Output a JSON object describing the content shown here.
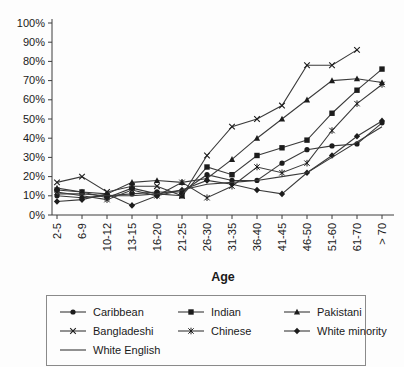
{
  "chart_data": {
    "type": "line",
    "title": "",
    "xlabel": "Age",
    "ylabel": "",
    "ylim": [
      0,
      100
    ],
    "y_tick_step": 10,
    "y_tick_labels": [
      "0%",
      "10%",
      "20%",
      "30%",
      "40%",
      "50%",
      "60%",
      "70%",
      "80%",
      "90%",
      "100%"
    ],
    "categories": [
      "2-5",
      "6-9",
      "10-12",
      "13-15",
      "16-20",
      "21-25",
      "26-30",
      "31-35",
      "36-40",
      "41-45",
      "46-50",
      "51-60",
      "61-70",
      "> 70"
    ],
    "series": [
      {
        "name": "Caribbean",
        "marker": "circle",
        "values": [
          10,
          9,
          10,
          11,
          12,
          12,
          21,
          18,
          18,
          27,
          34,
          36,
          37,
          48
        ]
      },
      {
        "name": "Indian",
        "marker": "square",
        "values": [
          13,
          12,
          9,
          14,
          11,
          10,
          25,
          21,
          31,
          35,
          39,
          53,
          65,
          76
        ]
      },
      {
        "name": "Pakistani",
        "marker": "triangle",
        "values": [
          14,
          12,
          11,
          17,
          18,
          17,
          19,
          29,
          40,
          50,
          60,
          70,
          71,
          69
        ]
      },
      {
        "name": "Bangladeshi",
        "marker": "x",
        "values": [
          17,
          20,
          12,
          15,
          15,
          10,
          31,
          46,
          50,
          57,
          78,
          78,
          86,
          null
        ]
      },
      {
        "name": "Chinese",
        "marker": "asterisk",
        "values": [
          12,
          10,
          8,
          13,
          10,
          17,
          9,
          15,
          25,
          22,
          27,
          44,
          58,
          68
        ]
      },
      {
        "name": "White minority",
        "marker": "diamond",
        "values": [
          7,
          8,
          11,
          5,
          10,
          13,
          18,
          16,
          13,
          11,
          22,
          31,
          41,
          49
        ]
      },
      {
        "name": "White English",
        "marker": "none",
        "values": [
          11,
          11,
          10,
          10,
          11,
          13,
          16,
          17,
          18,
          20,
          22,
          30,
          38,
          46
        ]
      }
    ],
    "grid": false,
    "legend_position": "bottom",
    "line_color": "#3a3a3a",
    "marker_color": "#1c1c1c",
    "axis_color": "#3c3c3c",
    "text_color": "#1a1a1a"
  }
}
